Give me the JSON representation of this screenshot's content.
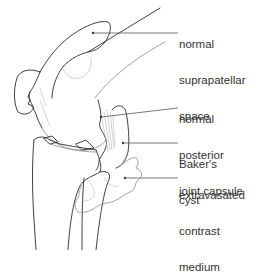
{
  "figure": {
    "colors": {
      "ink": "#2a2a2a",
      "text": "#333333",
      "background": "#ffffff"
    },
    "labels": [
      {
        "id": "suprapatellar",
        "lines": [
          "normal",
          "suprapatellar",
          "space"
        ]
      },
      {
        "id": "posterior-capsule",
        "lines": [
          "normal",
          "posterior",
          "joint capsule"
        ]
      },
      {
        "id": "bakers-cyst",
        "lines": [
          "Baker's",
          "cyst"
        ]
      },
      {
        "id": "contrast",
        "lines": [
          "extravasated",
          "contrast",
          "medium"
        ]
      }
    ]
  }
}
